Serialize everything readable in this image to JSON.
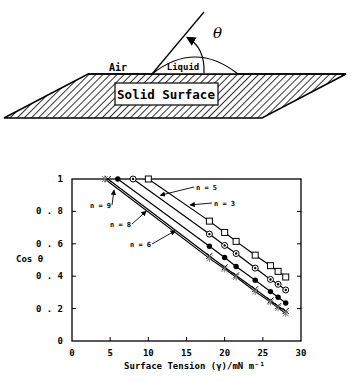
{
  "diagram": {
    "air_label": "Air",
    "liquid_label": "Liquid",
    "solid_label": "Solid Surface",
    "angle_label": "θ"
  },
  "chart_data": {
    "type": "line",
    "title": "",
    "xlabel": "Surface Tension (γ)/mN m⁻¹",
    "ylabel": "Cos θ",
    "xlim": [
      0,
      30
    ],
    "ylim": [
      0,
      1
    ],
    "xticks": [
      "0",
      "5",
      "10",
      "15",
      "20",
      "25",
      "30"
    ],
    "yticks": [
      "0",
      "0.2",
      "0.4",
      "0.6",
      "0.8",
      "1"
    ],
    "grid": false,
    "legend_position": "inline annotations with arrows",
    "series": [
      {
        "name": "n = 3",
        "marker": "open-square",
        "x": [
          10,
          18,
          20,
          21.5,
          24,
          26,
          27,
          28
        ],
        "y": [
          1.0,
          0.74,
          0.67,
          0.615,
          0.53,
          0.465,
          0.43,
          0.395
        ]
      },
      {
        "name": "n = 5",
        "marker": "circle-dot",
        "x": [
          8,
          18,
          20,
          21.5,
          24,
          26,
          27,
          28
        ],
        "y": [
          1.0,
          0.66,
          0.59,
          0.54,
          0.45,
          0.38,
          0.35,
          0.315
        ]
      },
      {
        "name": "n = 6",
        "marker": "filled-circle",
        "x": [
          6,
          18,
          20,
          21.5,
          24,
          26,
          27,
          28
        ],
        "y": [
          1.0,
          0.585,
          0.515,
          0.46,
          0.375,
          0.305,
          0.27,
          0.235
        ]
      },
      {
        "name": "n = 8",
        "marker": "x",
        "x": [
          4.7,
          18,
          20,
          21.5,
          24,
          26,
          27,
          28
        ],
        "y": [
          1.0,
          0.525,
          0.455,
          0.405,
          0.32,
          0.25,
          0.215,
          0.185
        ]
      },
      {
        "name": "n = 9",
        "marker": "asterisk",
        "x": [
          4.3,
          18,
          20,
          21.5,
          24,
          26,
          27,
          28
        ],
        "y": [
          1.0,
          0.51,
          0.445,
          0.395,
          0.305,
          0.24,
          0.205,
          0.17
        ]
      }
    ],
    "annotations": [
      {
        "text": "n = 9",
        "x_px": 90,
        "y_px": 208
      },
      {
        "text": "n = 8",
        "x_px": 110,
        "y_px": 227
      },
      {
        "text": "n = 6",
        "x_px": 130,
        "y_px": 247
      },
      {
        "text": "n = 5",
        "x_px": 196,
        "y_px": 190
      },
      {
        "text": "n = 3",
        "x_px": 214,
        "y_px": 206
      }
    ]
  }
}
